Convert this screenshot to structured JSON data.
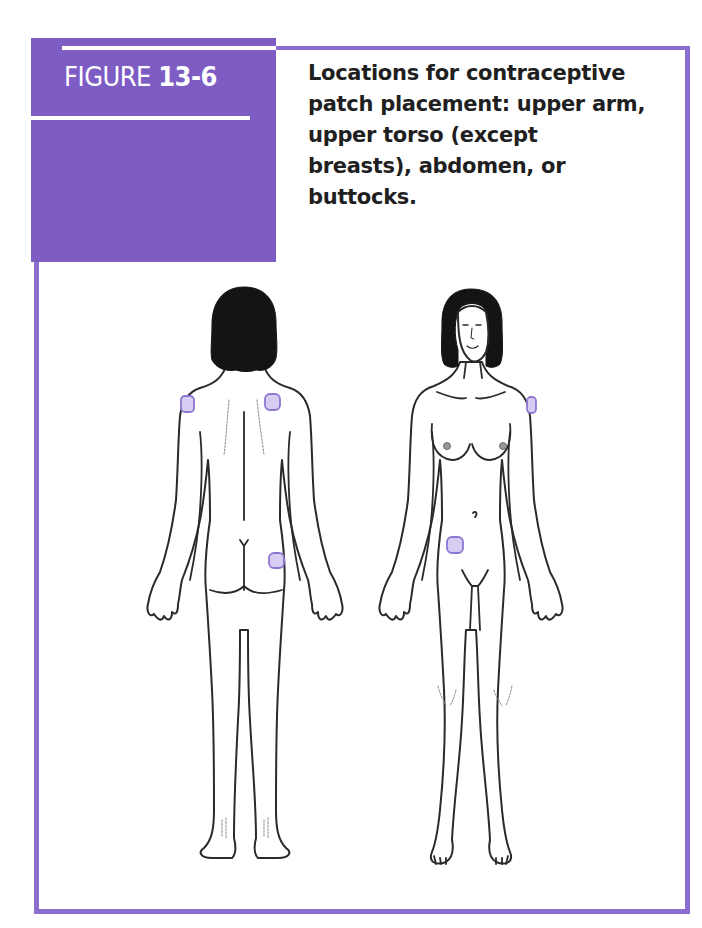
{
  "figure": {
    "label_prefix": "FIGURE",
    "label_number": "13-6",
    "caption": "Locations for contraceptive patch placement: upper arm, upper torso (except breasts), abdomen, or buttocks.",
    "accent_color": "#7d5cc4",
    "border_color": "#8a6fcf",
    "patch_color": "#d7cdf3"
  },
  "illustration": {
    "views": [
      {
        "name": "back view",
        "patches": [
          "upper arm (left)",
          "upper back / shoulder blade (right)",
          "buttock (right)"
        ]
      },
      {
        "name": "front view",
        "patches": [
          "upper arm (left side of figure)",
          "abdomen (lower right of figure)"
        ]
      }
    ],
    "placement_sites": [
      "upper arm",
      "upper torso (except breasts)",
      "abdomen",
      "buttocks"
    ]
  }
}
